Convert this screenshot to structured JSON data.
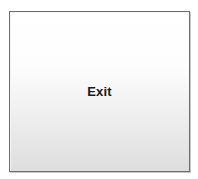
{
  "button": {
    "label": "Exit"
  }
}
